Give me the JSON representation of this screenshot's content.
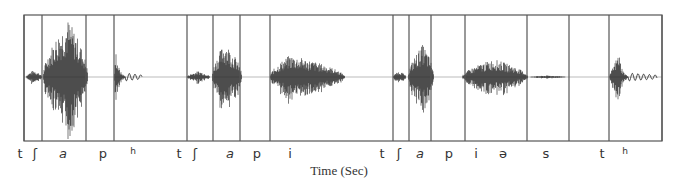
{
  "figure": {
    "type": "waveform-segmentation",
    "frame": {
      "left": 24,
      "top": 15,
      "right": 662,
      "bottom": 141,
      "baseline": 77
    },
    "boundaries_x": [
      24,
      42,
      86,
      114,
      187,
      213,
      240,
      270,
      393,
      409,
      431,
      465,
      527,
      569,
      609,
      662
    ],
    "segments_labels": [
      {
        "text": "t",
        "x": 20
      },
      {
        "text": "ʃ",
        "x": 35
      },
      {
        "text": "a",
        "x": 63,
        "italic": true
      },
      {
        "text": "p",
        "x": 103
      },
      {
        "text": "h",
        "x": 133,
        "sup": true
      },
      {
        "text": "t",
        "x": 179
      },
      {
        "text": "ʃ",
        "x": 195
      },
      {
        "text": "a",
        "x": 230,
        "italic": true
      },
      {
        "text": "p",
        "x": 257
      },
      {
        "text": "i",
        "x": 290
      },
      {
        "text": "t",
        "x": 382
      },
      {
        "text": "ʃ",
        "x": 399
      },
      {
        "text": "a",
        "x": 420,
        "italic": true
      },
      {
        "text": "p",
        "x": 449
      },
      {
        "text": "i",
        "x": 476
      },
      {
        "text": "ə",
        "x": 503
      },
      {
        "text": "s",
        "x": 546
      },
      {
        "text": "t",
        "x": 602
      },
      {
        "text": "h",
        "x": 625,
        "sup": true
      }
    ],
    "bursts": [
      {
        "x0": 26,
        "x1": 42,
        "amp": 7,
        "density": 1.0
      },
      {
        "x0": 43,
        "x1": 88,
        "amp": 58,
        "peak": 68,
        "density": 1.0
      },
      {
        "x0": 114,
        "x1": 125,
        "amp": 26,
        "peak": 116,
        "decay": true
      },
      {
        "x0": 125,
        "x1": 142,
        "amp": 4,
        "ripple": true
      },
      {
        "x0": 187,
        "x1": 210,
        "amp": 6,
        "density": 1.0
      },
      {
        "x0": 212,
        "x1": 242,
        "amp": 35,
        "peak": 225,
        "density": 1.0
      },
      {
        "x0": 270,
        "x1": 345,
        "amp": 22,
        "peak": 290,
        "density": 1.0
      },
      {
        "x0": 393,
        "x1": 406,
        "amp": 6,
        "density": 1.0
      },
      {
        "x0": 408,
        "x1": 434,
        "amp": 33,
        "peak": 423,
        "density": 1.0
      },
      {
        "x0": 462,
        "x1": 528,
        "amp": 18,
        "peak": 494,
        "density": 1.0
      },
      {
        "x0": 530,
        "x1": 566,
        "amp": 1.5,
        "density": 0.4
      },
      {
        "x0": 609,
        "x1": 628,
        "amp": 25,
        "peak": 619,
        "decay": true
      },
      {
        "x0": 628,
        "x1": 657,
        "amp": 4,
        "ripple": true
      }
    ],
    "colors": {
      "frame": "#555555",
      "wave": "#222222",
      "baseline": "#bbbbbb"
    }
  },
  "axis": {
    "xlabel": "Time (Sec)"
  }
}
